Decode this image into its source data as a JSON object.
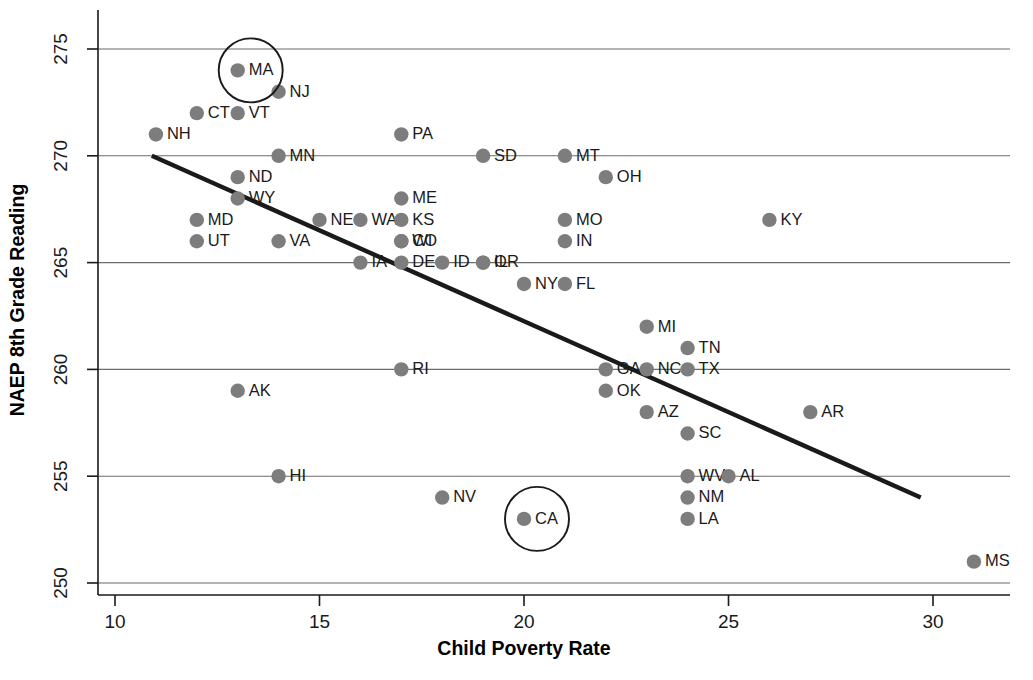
{
  "chart_data": {
    "type": "scatter",
    "title": "",
    "xlabel": "Child Poverty Rate",
    "ylabel": "NAEP 8th Grade Reading",
    "xlim": [
      9.2,
      31.8
    ],
    "ylim": [
      249.0,
      276.2
    ],
    "xticks": [
      10,
      15,
      20,
      25,
      30
    ],
    "yticks": [
      250,
      255,
      260,
      265,
      270,
      275
    ],
    "grid": "horizontal",
    "legend": "none",
    "point_color": "#7d7d7d",
    "line_color": "#1a1a1a",
    "trend_line": {
      "x": [
        10.9,
        29.7
      ],
      "y": [
        270.0,
        254.0
      ],
      "label": "regression-trend-line"
    },
    "highlighted": [
      "MA",
      "CA"
    ],
    "points": [
      {
        "label": "MA",
        "x": 13,
        "y": 274,
        "lp": "right",
        "circled": true
      },
      {
        "label": "NJ",
        "x": 14,
        "y": 273,
        "lp": "right",
        "circled": false
      },
      {
        "label": "CT",
        "x": 12,
        "y": 272,
        "lp": "right",
        "circled": false
      },
      {
        "label": "VT",
        "x": 13,
        "y": 272,
        "lp": "right",
        "circled": false
      },
      {
        "label": "NH",
        "x": 11,
        "y": 271,
        "lp": "right",
        "circled": false
      },
      {
        "label": "PA",
        "x": 17,
        "y": 271,
        "lp": "right",
        "circled": false
      },
      {
        "label": "MN",
        "x": 14,
        "y": 270,
        "lp": "right",
        "circled": false
      },
      {
        "label": "SD",
        "x": 19,
        "y": 270,
        "lp": "right",
        "circled": false
      },
      {
        "label": "MT",
        "x": 21,
        "y": 270,
        "lp": "right",
        "circled": false
      },
      {
        "label": "ND",
        "x": 13,
        "y": 269,
        "lp": "right",
        "circled": false
      },
      {
        "label": "OH",
        "x": 22,
        "y": 269,
        "lp": "right",
        "circled": false
      },
      {
        "label": "WY",
        "x": 13,
        "y": 268,
        "lp": "right",
        "circled": false
      },
      {
        "label": "ME",
        "x": 17,
        "y": 268,
        "lp": "right",
        "circled": false
      },
      {
        "label": "MD",
        "x": 12,
        "y": 267,
        "lp": "right",
        "circled": false
      },
      {
        "label": "NE",
        "x": 15,
        "y": 267,
        "lp": "right",
        "circled": false
      },
      {
        "label": "WA",
        "x": 16,
        "y": 267,
        "lp": "right",
        "circled": false
      },
      {
        "label": "KS",
        "x": 17,
        "y": 267,
        "lp": "right",
        "circled": false
      },
      {
        "label": "MO",
        "x": 21,
        "y": 267,
        "lp": "right",
        "circled": false
      },
      {
        "label": "KY",
        "x": 26,
        "y": 267,
        "lp": "right",
        "circled": false
      },
      {
        "label": "UT",
        "x": 12,
        "y": 266,
        "lp": "right",
        "circled": false
      },
      {
        "label": "VA",
        "x": 14,
        "y": 266,
        "lp": "right",
        "circled": false
      },
      {
        "label": "WI",
        "x": 17,
        "y": 266,
        "lp": "right",
        "circled": false
      },
      {
        "label": "CO",
        "x": 17,
        "y": 266,
        "lp": "right",
        "circled": false
      },
      {
        "label": "IN",
        "x": 21,
        "y": 266,
        "lp": "right",
        "circled": false
      },
      {
        "label": "IA",
        "x": 16,
        "y": 265,
        "lp": "right",
        "circled": false
      },
      {
        "label": "DE",
        "x": 17,
        "y": 265,
        "lp": "right",
        "circled": false
      },
      {
        "label": "ID",
        "x": 18,
        "y": 265,
        "lp": "right",
        "circled": false
      },
      {
        "label": "OR",
        "x": 19,
        "y": 265,
        "lp": "right",
        "circled": false
      },
      {
        "label": "IL",
        "x": 19,
        "y": 265,
        "lp": "right",
        "circled": false
      },
      {
        "label": "NY",
        "x": 20,
        "y": 264,
        "lp": "right",
        "circled": false
      },
      {
        "label": "FL",
        "x": 21,
        "y": 264,
        "lp": "right",
        "circled": false
      },
      {
        "label": "MI",
        "x": 23,
        "y": 262,
        "lp": "right",
        "circled": false
      },
      {
        "label": "TN",
        "x": 24,
        "y": 261,
        "lp": "right",
        "circled": false
      },
      {
        "label": "RI",
        "x": 17,
        "y": 260,
        "lp": "right",
        "circled": false
      },
      {
        "label": "GA",
        "x": 22,
        "y": 260,
        "lp": "right",
        "circled": false
      },
      {
        "label": "NC",
        "x": 23,
        "y": 260,
        "lp": "right",
        "circled": false
      },
      {
        "label": "TX",
        "x": 24,
        "y": 260,
        "lp": "right",
        "circled": false
      },
      {
        "label": "AK",
        "x": 13,
        "y": 259,
        "lp": "right",
        "circled": false
      },
      {
        "label": "OK",
        "x": 22,
        "y": 259,
        "lp": "right",
        "circled": false
      },
      {
        "label": "AZ",
        "x": 23,
        "y": 258,
        "lp": "right",
        "circled": false
      },
      {
        "label": "AR",
        "x": 27,
        "y": 258,
        "lp": "right",
        "circled": false
      },
      {
        "label": "SC",
        "x": 24,
        "y": 257,
        "lp": "right",
        "circled": false
      },
      {
        "label": "HI",
        "x": 14,
        "y": 255,
        "lp": "right",
        "circled": false
      },
      {
        "label": "WV",
        "x": 24,
        "y": 255,
        "lp": "right",
        "circled": false
      },
      {
        "label": "AL",
        "x": 25,
        "y": 255,
        "lp": "right",
        "circled": false
      },
      {
        "label": "NV",
        "x": 18,
        "y": 254,
        "lp": "right",
        "circled": false
      },
      {
        "label": "NM",
        "x": 24,
        "y": 254,
        "lp": "right",
        "circled": false
      },
      {
        "label": "CA",
        "x": 20,
        "y": 253,
        "lp": "right",
        "circled": true
      },
      {
        "label": "LA",
        "x": 24,
        "y": 253,
        "lp": "right",
        "circled": false
      },
      {
        "label": "MS",
        "x": 31,
        "y": 251,
        "lp": "right",
        "circled": false
      }
    ]
  },
  "axes": {
    "y_title": "NAEP 8th Grade Reading",
    "x_title": "Child Poverty Rate"
  }
}
